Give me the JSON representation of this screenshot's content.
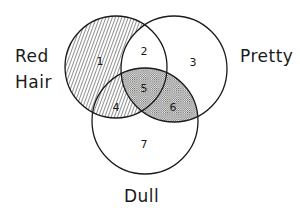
{
  "diagram": {
    "type": "venn",
    "sets": [
      {
        "id": "red_hair",
        "label_lines": [
          "Red",
          "Hair"
        ],
        "cx": 116,
        "cy": 67,
        "r": 51
      },
      {
        "id": "pretty",
        "label_lines": [
          "Pretty"
        ],
        "cx": 174,
        "cy": 69,
        "r": 53
      },
      {
        "id": "dull",
        "label_lines": [
          "Dull"
        ],
        "cx": 145,
        "cy": 121,
        "r": 53
      }
    ],
    "labels": {
      "red": "Red",
      "hair": "Hair",
      "pretty": "Pretty",
      "dull": "Dull"
    },
    "regions": [
      {
        "num": "1",
        "x": 100,
        "y": 62,
        "fill": "hatched"
      },
      {
        "num": "2",
        "x": 144,
        "y": 52,
        "fill": "none"
      },
      {
        "num": "3",
        "x": 192,
        "y": 63,
        "fill": "none"
      },
      {
        "num": "4",
        "x": 116,
        "y": 108,
        "fill": "hatched"
      },
      {
        "num": "5",
        "x": 144,
        "y": 89,
        "fill": "dotted"
      },
      {
        "num": "6",
        "x": 173,
        "y": 108,
        "fill": "dotted"
      },
      {
        "num": "7",
        "x": 144,
        "y": 145,
        "fill": "none"
      }
    ],
    "shading": {
      "hatched": "Red Hair not Pretty (regions 1, 4)",
      "dotted": "Pretty and Dull (regions 5, 6)"
    },
    "colors": {
      "stroke": "#1a1a1a",
      "hatch": "#333333",
      "dot": "#555555",
      "background": "#ffffff"
    }
  }
}
